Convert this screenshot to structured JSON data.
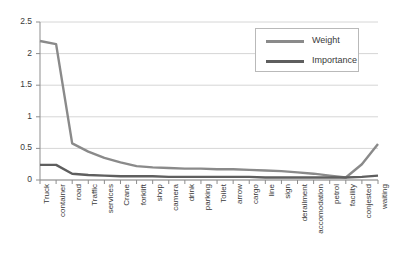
{
  "chart_data": {
    "type": "line",
    "title": "",
    "xlabel": "",
    "ylabel": "",
    "ylim": [
      0,
      2.5
    ],
    "yticks": [
      0,
      0.5,
      1,
      1.5,
      2,
      2.5
    ],
    "ytick_labels": [
      "0",
      "0.5",
      "1",
      "1.5",
      "2",
      "2.5"
    ],
    "grid": true,
    "legend_position": "upper right",
    "categories": [
      "Truck",
      "container",
      "road",
      "Traffic",
      "services",
      "Crane",
      "forklift",
      "shop",
      "camera",
      "drink",
      "parking",
      "Toilet",
      "arrow",
      "cargo",
      "line",
      "sign",
      "derailment",
      "accomodation",
      "petrol",
      "facility",
      "conjested",
      "waiting"
    ],
    "series": [
      {
        "name": "Weight",
        "color": "#8a8a8a",
        "values": [
          2.2,
          2.15,
          0.58,
          0.45,
          0.35,
          0.28,
          0.22,
          0.2,
          0.19,
          0.18,
          0.18,
          0.17,
          0.17,
          0.16,
          0.15,
          0.14,
          0.12,
          0.1,
          0.07,
          0.04,
          0.25,
          0.57
        ]
      },
      {
        "name": "Importance",
        "color": "#5e5e5e",
        "values": [
          0.24,
          0.24,
          0.1,
          0.08,
          0.07,
          0.06,
          0.06,
          0.06,
          0.05,
          0.05,
          0.05,
          0.05,
          0.05,
          0.05,
          0.04,
          0.04,
          0.04,
          0.04,
          0.04,
          0.04,
          0.05,
          0.07
        ]
      }
    ]
  },
  "legend": {
    "entries": [
      {
        "label": "Weight"
      },
      {
        "label": "Importance"
      }
    ]
  },
  "axes": {
    "axis_color": "#8d8d8d",
    "grid_color": "#d6d6d6",
    "tick_color": "#8d8d8d"
  }
}
